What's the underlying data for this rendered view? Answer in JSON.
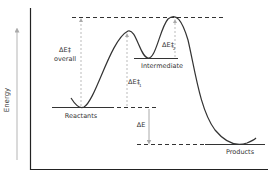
{
  "diagram": {
    "type": "reaction-energy-profile",
    "axis": {
      "y_label": "Energy"
    },
    "states": {
      "reactants": "Reactants",
      "intermediate": "Intermediate",
      "products": "Products"
    },
    "annotations": {
      "overall_barrier_symbol": "ΔE‡",
      "overall_barrier_word": "overall",
      "barrier1_symbol": "ΔE‡",
      "barrier1_sub": "1",
      "barrier2_symbol": "ΔE‡",
      "barrier2_sub": "2",
      "reaction_energy": "ΔE"
    },
    "colors": {
      "curve": "#333333",
      "axis": "#222222",
      "dashed": "#333333",
      "arrow": "#aaaaaa",
      "text": "#333333"
    }
  }
}
